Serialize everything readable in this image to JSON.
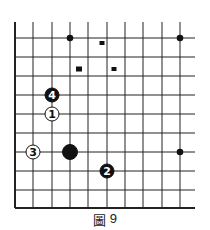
{
  "diagram": {
    "type": "go-board-fragment",
    "caption": {
      "label": "圖",
      "number": "9"
    },
    "grid": {
      "columns_x": [
        15,
        33,
        52,
        70,
        88,
        107,
        125,
        143,
        162,
        180
      ],
      "rows_y": [
        38,
        57,
        76,
        95,
        114,
        133,
        152,
        171,
        190,
        208
      ],
      "top_open_y": 22,
      "right_open_x": 195,
      "edges": [
        "left",
        "bottom"
      ]
    },
    "star_points": [
      {
        "x": 70,
        "y": 38
      },
      {
        "x": 180,
        "y": 38
      },
      {
        "x": 180,
        "y": 152
      }
    ],
    "markers": [
      {
        "shape": "square",
        "x": 102,
        "y": 43
      },
      {
        "shape": "square",
        "x": 79,
        "y": 69
      },
      {
        "shape": "square",
        "x": 114,
        "y": 69
      }
    ],
    "stones": [
      {
        "color": "black",
        "label": "4",
        "x": 52,
        "y": 95
      },
      {
        "color": "white",
        "label": "1",
        "x": 52,
        "y": 114
      },
      {
        "color": "white",
        "label": "3",
        "x": 33,
        "y": 152
      },
      {
        "color": "black",
        "label": "",
        "x": 70,
        "y": 152,
        "size": "large"
      },
      {
        "color": "black",
        "label": "2",
        "x": 107,
        "y": 171
      }
    ],
    "colors": {
      "line": "#222222",
      "black_stone": "#111111",
      "white_stone": "#ffffff",
      "background": "#ffffff"
    }
  }
}
